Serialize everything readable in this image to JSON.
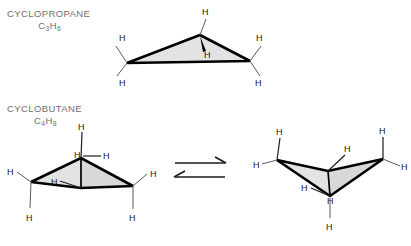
{
  "figure": {
    "background_color": "#ffffff",
    "label_color": "#6f6f6f",
    "atom_label_color": "#1a1a1a",
    "bond_color": "#000000",
    "hydrogen_bond_color": "#5a5a5a",
    "ring_fill_color": "#e3e3e3"
  },
  "compounds": [
    {
      "id": "cyclopropane",
      "name": "CYCLOPROPANE",
      "formula_c": "C",
      "formula_c_sub": "3",
      "formula_h": "H",
      "formula_h_sub": "6",
      "formula_plain": "C3H6",
      "ring_size": 3,
      "conformation": "planar triangle",
      "hydrogen_labels": [
        "H",
        "H",
        "H",
        "H",
        "H",
        "H"
      ],
      "hydrogen_count": 6
    },
    {
      "id": "cyclobutane",
      "name": "CYCLOBUTANE",
      "formula_c": "C",
      "formula_c_sub": "4",
      "formula_h": "H",
      "formula_h_sub": "8",
      "formula_plain": "C4H8",
      "ring_size": 4,
      "conformation": "puckered butterfly",
      "hydrogen_labels": [
        "H",
        "H",
        "H",
        "H",
        "H",
        "H",
        "H",
        "H"
      ],
      "hydrogen_count": 8
    }
  ],
  "equilibrium": {
    "name": "ring-flip equilibrium",
    "forward_arrow": "right",
    "reverse_arrow": "left",
    "symbol": "⇌"
  },
  "atoms": {
    "hydrogen_symbol": "H",
    "cyclopropane_h": [
      {
        "key": "top",
        "text": "H"
      },
      {
        "key": "center-inner",
        "text": "H"
      },
      {
        "key": "left-upper",
        "text": "H"
      },
      {
        "key": "left-lower",
        "text": "H"
      },
      {
        "key": "right-upper",
        "text": "H"
      },
      {
        "key": "right-lower",
        "text": "H"
      }
    ],
    "cyclobutane_left_h": [
      {
        "key": "apex-up",
        "text": "H"
      },
      {
        "key": "apex-label",
        "text": "H"
      },
      {
        "key": "apex-right",
        "text": "H"
      },
      {
        "key": "inner-left",
        "text": "H"
      },
      {
        "key": "left-outer",
        "text": "H"
      },
      {
        "key": "left-down",
        "text": "H"
      },
      {
        "key": "right-outer",
        "text": "H"
      },
      {
        "key": "right-down",
        "text": "H"
      }
    ],
    "cyclobutane_right_h": [
      {
        "key": "left-up",
        "text": "H"
      },
      {
        "key": "left-outer",
        "text": "H"
      },
      {
        "key": "inner-upper",
        "text": "H"
      },
      {
        "key": "right-up",
        "text": "H"
      },
      {
        "key": "right-outer",
        "text": "H"
      },
      {
        "key": "bottom-left",
        "text": "H"
      },
      {
        "key": "bottom-mid",
        "text": "H"
      },
      {
        "key": "bottom-down",
        "text": "H"
      }
    ]
  }
}
